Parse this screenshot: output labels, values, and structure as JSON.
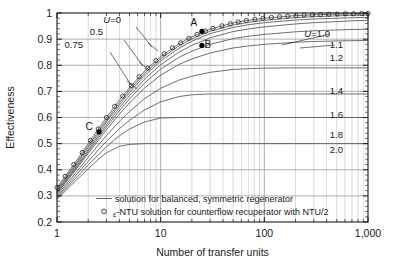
{
  "chart_data": {
    "type": "line",
    "title": "",
    "xlabel": "Number of transfer units",
    "ylabel": "Effectiveness",
    "xscale": "log",
    "xlim": [
      1,
      1000
    ],
    "ylim": [
      0.2,
      1.0
    ],
    "grid": true,
    "xticks": [
      1,
      10,
      100,
      1000
    ],
    "xtick_labels": [
      "1",
      "10",
      "100",
      "1,000"
    ],
    "yticks": [
      0.2,
      0.3,
      0.4,
      0.5,
      0.6,
      0.7,
      0.8,
      0.9,
      1.0
    ],
    "ytick_labels": [
      "0.2",
      "0.3",
      "0.4",
      "0.5",
      "0.6",
      "0.7",
      "0.8",
      "0.9",
      "1"
    ],
    "legend_position": "inside-bottom-left",
    "legend": [
      {
        "marker": "line",
        "label": "solution for balanced, symmetric regenerator"
      },
      {
        "marker": "circle",
        "label_prefix": "ε",
        "label": "-NTU solution for counterflow recuperator with NTU/2"
      }
    ],
    "series": [
      {
        "name": "U=0",
        "label": "U=0",
        "label_italic_prefix": "U",
        "asymptote": 1.0,
        "points": [
          [
            1,
            0.332
          ],
          [
            1.5,
            0.428
          ],
          [
            2,
            0.5
          ],
          [
            2.5,
            0.556
          ],
          [
            3,
            0.6
          ],
          [
            4,
            0.667
          ],
          [
            5,
            0.714
          ],
          [
            7,
            0.778
          ],
          [
            10,
            0.833
          ],
          [
            15,
            0.882
          ],
          [
            20,
            0.909
          ],
          [
            30,
            0.938
          ],
          [
            50,
            0.962
          ],
          [
            70,
            0.972
          ],
          [
            100,
            0.98
          ],
          [
            200,
            0.99
          ],
          [
            300,
            0.993
          ],
          [
            500,
            0.996
          ],
          [
            700,
            0.997
          ],
          [
            1000,
            0.998
          ]
        ]
      },
      {
        "name": "U=0.5",
        "label": "0.5",
        "asymptote": 0.995,
        "points": [
          [
            1,
            0.325
          ],
          [
            1.5,
            0.42
          ],
          [
            2,
            0.491
          ],
          [
            2.5,
            0.546
          ],
          [
            3,
            0.59
          ],
          [
            4,
            0.657
          ],
          [
            5,
            0.705
          ],
          [
            7,
            0.769
          ],
          [
            10,
            0.825
          ],
          [
            15,
            0.874
          ],
          [
            20,
            0.901
          ],
          [
            30,
            0.93
          ],
          [
            50,
            0.954
          ],
          [
            70,
            0.964
          ],
          [
            100,
            0.972
          ],
          [
            200,
            0.982
          ],
          [
            300,
            0.986
          ],
          [
            500,
            0.989
          ],
          [
            700,
            0.991
          ],
          [
            1000,
            0.992
          ]
        ]
      },
      {
        "name": "U=0.75",
        "label": "0.75",
        "asymptote": 0.99,
        "points": [
          [
            1,
            0.32
          ],
          [
            1.5,
            0.414
          ],
          [
            2,
            0.484
          ],
          [
            2.5,
            0.538
          ],
          [
            3,
            0.582
          ],
          [
            4,
            0.648
          ],
          [
            5,
            0.696
          ],
          [
            7,
            0.76
          ],
          [
            10,
            0.816
          ],
          [
            15,
            0.865
          ],
          [
            20,
            0.892
          ],
          [
            30,
            0.921
          ],
          [
            50,
            0.945
          ],
          [
            70,
            0.955
          ],
          [
            100,
            0.963
          ],
          [
            200,
            0.973
          ],
          [
            300,
            0.977
          ],
          [
            500,
            0.98
          ],
          [
            700,
            0.982
          ],
          [
            1000,
            0.983
          ]
        ]
      },
      {
        "name": "U=1.0",
        "label": "U=1.0",
        "label_italic_prefix": "U",
        "asymptote": 0.975,
        "points": [
          [
            1,
            0.315
          ],
          [
            1.5,
            0.407
          ],
          [
            2,
            0.476
          ],
          [
            2.5,
            0.529
          ],
          [
            3,
            0.572
          ],
          [
            4,
            0.637
          ],
          [
            5,
            0.684
          ],
          [
            7,
            0.747
          ],
          [
            10,
            0.802
          ],
          [
            15,
            0.85
          ],
          [
            20,
            0.876
          ],
          [
            30,
            0.905
          ],
          [
            50,
            0.929
          ],
          [
            70,
            0.939
          ],
          [
            100,
            0.947
          ],
          [
            200,
            0.958
          ],
          [
            300,
            0.963
          ],
          [
            500,
            0.967
          ],
          [
            700,
            0.97
          ],
          [
            1000,
            0.972
          ]
        ]
      },
      {
        "name": "U=1.1",
        "label": "1.1",
        "asymptote": 0.94,
        "points": [
          [
            1,
            0.312
          ],
          [
            1.5,
            0.402
          ],
          [
            2,
            0.469
          ],
          [
            2.5,
            0.521
          ],
          [
            3,
            0.563
          ],
          [
            4,
            0.626
          ],
          [
            5,
            0.671
          ],
          [
            7,
            0.732
          ],
          [
            10,
            0.785
          ],
          [
            15,
            0.83
          ],
          [
            20,
            0.854
          ],
          [
            30,
            0.88
          ],
          [
            50,
            0.902
          ],
          [
            70,
            0.911
          ],
          [
            100,
            0.918
          ],
          [
            200,
            0.928
          ],
          [
            300,
            0.932
          ],
          [
            500,
            0.935
          ],
          [
            700,
            0.937
          ],
          [
            1000,
            0.938
          ]
        ]
      },
      {
        "name": "U=1.2",
        "label": "1.2",
        "asymptote": 0.895,
        "points": [
          [
            1,
            0.309
          ],
          [
            1.5,
            0.397
          ],
          [
            2,
            0.462
          ],
          [
            2.5,
            0.512
          ],
          [
            3,
            0.553
          ],
          [
            4,
            0.613
          ],
          [
            5,
            0.656
          ],
          [
            7,
            0.713
          ],
          [
            10,
            0.762
          ],
          [
            15,
            0.803
          ],
          [
            20,
            0.824
          ],
          [
            30,
            0.847
          ],
          [
            50,
            0.866
          ],
          [
            70,
            0.874
          ],
          [
            100,
            0.88
          ],
          [
            200,
            0.888
          ],
          [
            300,
            0.891
          ],
          [
            500,
            0.893
          ],
          [
            700,
            0.894
          ],
          [
            1000,
            0.895
          ]
        ]
      },
      {
        "name": "U=1.4",
        "label": "1.4",
        "asymptote": 0.79,
        "points": [
          [
            1,
            0.303
          ],
          [
            1.5,
            0.386
          ],
          [
            2,
            0.447
          ],
          [
            2.5,
            0.494
          ],
          [
            3,
            0.531
          ],
          [
            4,
            0.585
          ],
          [
            5,
            0.623
          ],
          [
            7,
            0.672
          ],
          [
            10,
            0.712
          ],
          [
            15,
            0.743
          ],
          [
            20,
            0.758
          ],
          [
            30,
            0.773
          ],
          [
            50,
            0.784
          ],
          [
            70,
            0.787
          ],
          [
            100,
            0.789
          ],
          [
            200,
            0.79
          ],
          [
            300,
            0.79
          ],
          [
            500,
            0.79
          ],
          [
            700,
            0.79
          ],
          [
            1000,
            0.79
          ]
        ]
      },
      {
        "name": "U=1.6",
        "label": "1.6",
        "asymptote": 0.69,
        "points": [
          [
            1,
            0.297
          ],
          [
            1.5,
            0.376
          ],
          [
            2,
            0.432
          ],
          [
            2.5,
            0.475
          ],
          [
            3,
            0.509
          ],
          [
            4,
            0.557
          ],
          [
            5,
            0.589
          ],
          [
            7,
            0.629
          ],
          [
            10,
            0.66
          ],
          [
            15,
            0.68
          ],
          [
            20,
            0.687
          ],
          [
            30,
            0.69
          ],
          [
            50,
            0.69
          ],
          [
            70,
            0.69
          ],
          [
            100,
            0.69
          ],
          [
            200,
            0.69
          ],
          [
            300,
            0.69
          ],
          [
            500,
            0.69
          ],
          [
            700,
            0.69
          ],
          [
            1000,
            0.69
          ]
        ]
      },
      {
        "name": "U=1.8",
        "label": "1.8",
        "asymptote": 0.6,
        "points": [
          [
            1,
            0.292
          ],
          [
            1.5,
            0.366
          ],
          [
            2,
            0.418
          ],
          [
            2.5,
            0.457
          ],
          [
            3,
            0.488
          ],
          [
            4,
            0.53
          ],
          [
            5,
            0.556
          ],
          [
            7,
            0.583
          ],
          [
            10,
            0.598
          ],
          [
            15,
            0.6
          ],
          [
            20,
            0.6
          ],
          [
            30,
            0.6
          ],
          [
            50,
            0.6
          ],
          [
            70,
            0.6
          ],
          [
            100,
            0.6
          ],
          [
            200,
            0.6
          ],
          [
            300,
            0.6
          ],
          [
            500,
            0.6
          ],
          [
            700,
            0.6
          ],
          [
            1000,
            0.6
          ]
        ]
      },
      {
        "name": "U=2.0",
        "label": "2.0",
        "asymptote": 0.5,
        "points": [
          [
            1,
            0.287
          ],
          [
            1.5,
            0.356
          ],
          [
            2,
            0.404
          ],
          [
            2.5,
            0.439
          ],
          [
            3,
            0.465
          ],
          [
            4,
            0.49
          ],
          [
            5,
            0.497
          ],
          [
            7,
            0.5
          ],
          [
            10,
            0.5
          ],
          [
            15,
            0.5
          ],
          [
            20,
            0.5
          ],
          [
            30,
            0.5
          ],
          [
            50,
            0.5
          ],
          [
            70,
            0.5
          ],
          [
            100,
            0.5
          ],
          [
            200,
            0.5
          ],
          [
            300,
            0.5
          ],
          [
            500,
            0.5
          ],
          [
            700,
            0.5
          ],
          [
            1000,
            0.5
          ]
        ]
      }
    ],
    "marker_series": {
      "name": "ε-NTU counterflow recuperator with NTU/2",
      "marker": "open-circle",
      "points": [
        [
          1,
          0.332
        ],
        [
          1.2,
          0.375
        ],
        [
          1.45,
          0.42
        ],
        [
          1.75,
          0.466
        ],
        [
          2.1,
          0.512
        ],
        [
          2.5,
          0.556
        ],
        [
          3.0,
          0.6
        ],
        [
          3.6,
          0.643
        ],
        [
          4.3,
          0.682
        ],
        [
          5.2,
          0.722
        ],
        [
          6.2,
          0.756
        ],
        [
          7.5,
          0.789
        ],
        [
          9.0,
          0.818
        ],
        [
          10.8,
          0.844
        ],
        [
          13,
          0.867
        ],
        [
          15.6,
          0.886
        ],
        [
          18.7,
          0.903
        ],
        [
          22.5,
          0.918
        ],
        [
          27,
          0.931
        ],
        [
          32,
          0.941
        ],
        [
          39,
          0.951
        ],
        [
          47,
          0.959
        ],
        [
          56,
          0.966
        ],
        [
          67,
          0.971
        ],
        [
          81,
          0.976
        ],
        [
          97,
          0.98
        ],
        [
          117,
          0.983
        ],
        [
          140,
          0.986
        ],
        [
          168,
          0.988
        ],
        [
          202,
          0.99
        ],
        [
          242,
          0.992
        ],
        [
          291,
          0.993
        ],
        [
          349,
          0.994
        ],
        [
          419,
          0.995
        ],
        [
          503,
          0.996
        ],
        [
          604,
          0.997
        ],
        [
          725,
          0.997
        ],
        [
          870,
          0.998
        ],
        [
          1000,
          0.998
        ]
      ]
    },
    "annotations": [
      {
        "name": "point-a",
        "label": "A",
        "x": 25,
        "y": 0.93,
        "label_dx": -8,
        "label_dy": -5
      },
      {
        "name": "point-b",
        "label": "B",
        "x": 25,
        "y": 0.876,
        "label_dx": 6,
        "label_dy": 3
      },
      {
        "name": "point-c",
        "label": "C",
        "x": 2.55,
        "y": 0.545,
        "label_dx": -10,
        "label_dy": -2
      }
    ],
    "left_labels": [
      {
        "name": "label-u-0",
        "text": "U=0",
        "italic_prefix": "U",
        "x": 121,
        "y": 23
      },
      {
        "name": "label-u-0-5",
        "text": "0.5",
        "x": 103,
        "y": 35
      },
      {
        "name": "label-u-0-75",
        "text": "0.75",
        "x": 83,
        "y": 48
      }
    ],
    "right_labels": [
      {
        "name": "label-u-1-0",
        "text": "U=1.0",
        "italic_prefix": "U",
        "x": 330,
        "y": 37
      },
      {
        "name": "label-u-1-1",
        "text": "1.1",
        "x": 343,
        "y": 48
      },
      {
        "name": "label-u-1-2",
        "text": "1.2",
        "x": 343,
        "y": 61
      },
      {
        "name": "label-u-1-4",
        "text": "1.4",
        "x": 343,
        "y": 94
      },
      {
        "name": "label-u-1-6",
        "text": "1.6",
        "x": 343,
        "y": 118
      },
      {
        "name": "label-u-1-8",
        "text": "1.8",
        "x": 343,
        "y": 138
      },
      {
        "name": "label-u-2-0",
        "text": "2.0",
        "x": 343,
        "y": 153
      }
    ],
    "colors": {
      "axis": "#1a1a1a",
      "grid": "#9a9a9a",
      "curve": "#555555",
      "marker_stroke": "#222222",
      "point_fill": "#000000",
      "background": "#ffffff"
    }
  }
}
